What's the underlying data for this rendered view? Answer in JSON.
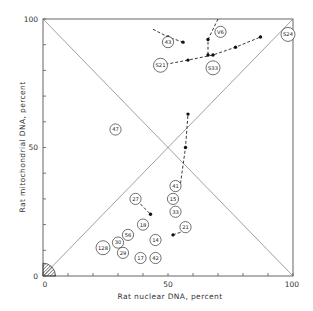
{
  "chart_data": {
    "type": "scatter",
    "title": "",
    "xlabel": "Rat nuclear DNA, percent",
    "ylabel": "Rat mitochondrial DNA, percent",
    "xlim": [
      0,
      100
    ],
    "ylim": [
      0,
      100
    ],
    "x_ticks": [
      0,
      50,
      100
    ],
    "y_ticks": [
      0,
      50,
      100
    ],
    "x_minor_tick_step": 10,
    "y_minor_tick_step": 10,
    "grid": false,
    "legend": null,
    "reference_lines": [
      {
        "from": [
          0,
          0
        ],
        "to": [
          100,
          100
        ],
        "style": "solid"
      },
      {
        "from": [
          0,
          100
        ],
        "to": [
          100,
          0
        ],
        "style": "solid"
      }
    ],
    "shaded_region": {
      "shape": "quarter-circle",
      "center": [
        0,
        0
      ],
      "radius": 5,
      "fill": "hatched"
    },
    "points": [
      {
        "label": "43",
        "x": 50,
        "y": 91
      },
      {
        "label": "V6",
        "x": 71,
        "y": 95
      },
      {
        "label": "S24",
        "x": 100,
        "y": 94
      },
      {
        "label": "S21",
        "x": 47,
        "y": 82
      },
      {
        "label": "S33",
        "x": 68,
        "y": 81
      },
      {
        "label": "47",
        "x": 29,
        "y": 57
      },
      {
        "label": "41",
        "x": 53,
        "y": 35
      },
      {
        "label": "27",
        "x": 37,
        "y": 30
      },
      {
        "label": "15",
        "x": 52,
        "y": 30
      },
      {
        "label": "33",
        "x": 53,
        "y": 25
      },
      {
        "label": "18",
        "x": 40,
        "y": 20
      },
      {
        "label": "21",
        "x": 57,
        "y": 19
      },
      {
        "label": "56",
        "x": 34,
        "y": 16
      },
      {
        "label": "14",
        "x": 45,
        "y": 14
      },
      {
        "label": "30",
        "x": 30,
        "y": 13
      },
      {
        "label": "128",
        "x": 24,
        "y": 11
      },
      {
        "label": "29",
        "x": 32,
        "y": 9
      },
      {
        "label": "17",
        "x": 39,
        "y": 7
      },
      {
        "label": "42",
        "x": 45,
        "y": 7
      }
    ],
    "trajectories": [
      {
        "from_label": "43",
        "points": [
          [
            44,
            96
          ],
          [
            50,
            93
          ],
          [
            56,
            91
          ]
        ]
      },
      {
        "from_label": "V6",
        "points": [
          [
            70,
            100
          ],
          [
            66,
            92
          ],
          [
            66,
            86
          ]
        ]
      },
      {
        "from_label": "S21",
        "points": [
          [
            47,
            82
          ],
          [
            58,
            84
          ],
          [
            68,
            86
          ],
          [
            77,
            89
          ],
          [
            87,
            93
          ]
        ]
      },
      {
        "from_label": "41",
        "points": [
          [
            55,
            36
          ],
          [
            57,
            50
          ],
          [
            58,
            63
          ]
        ]
      },
      {
        "from_label": "27",
        "points": [
          [
            39,
            28
          ],
          [
            43,
            24
          ]
        ]
      },
      {
        "from_label": "21",
        "points": [
          [
            55,
            17
          ],
          [
            52,
            16
          ]
        ]
      }
    ]
  },
  "axes": {
    "x_label": "Rat nuclear DNA, percent",
    "y_label": "Rat mitochondrial DNA, percent",
    "x_tick_labels": [
      "0",
      "50",
      "100"
    ],
    "y_tick_labels": [
      "0",
      "50",
      "100"
    ]
  }
}
